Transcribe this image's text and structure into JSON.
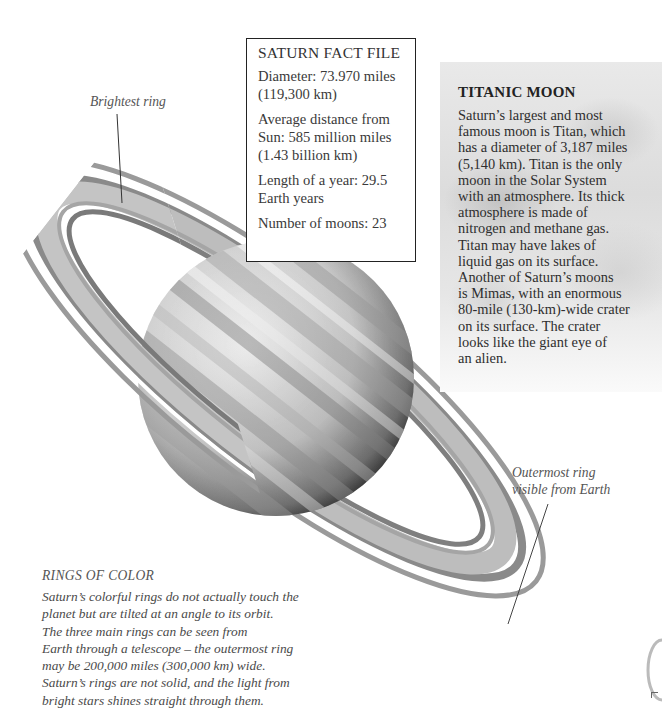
{
  "fact_file": {
    "title": "SATURN FACT FILE",
    "items": [
      "Diameter: 73.970 miles (119,300 km)",
      "Average distance from Sun: 585 million miles (1.43 billion km)",
      "Length of a year: 29.5 Earth years",
      "Number of moons: 23"
    ]
  },
  "titanic_moon": {
    "title": "TITANIC MOON",
    "body": "Saturn’s largest and most\nfamous moon is Titan, which\nhas a diameter of 3,187 miles\n(5,140 km). Titan is the only\nmoon in the Solar System\nwith an atmosphere. Its thick\natmosphere is made of\nnitrogen and methane gas.\nTitan may have lakes of\nliquid gas on its surface.\nAnother of Saturn’s moons\nis Mimas, with  an enormous\n80-mile (130-km)-wide crater\non its surface. The crater\nlooks like the giant eye of\nan alien."
  },
  "labels": {
    "brightest_ring": "Brightest ring",
    "outermost_ring": "Outermost ring\nvisible from Earth"
  },
  "rings_of_color": {
    "title": "RINGS OF COLOR",
    "body": "Saturn’s colorful rings do not actually touch the\nplanet but are tilted at an angle to its orbit.\nThe three main rings can be seen from\nEarth through a telescope – the outermost ring\nmay be 200,000 miles (300,000 km) wide.\nSaturn’s rings are not solid, and the light from\nbright stars shines straight through them."
  },
  "illustration": {
    "subject": "Saturn with rings",
    "style": "grayscale"
  }
}
